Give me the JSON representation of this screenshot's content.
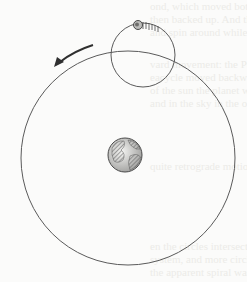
{
  "diagram": {
    "title": "",
    "colors": {
      "line": "#5a5a5a",
      "background": "#fbfbfa",
      "earth": "#6b6b6b"
    },
    "deferent": {
      "cx": 128,
      "cy": 158,
      "r": 107
    },
    "epicycle": {
      "cx": 143,
      "cy": 55,
      "r": 32
    },
    "planet": {
      "cx": 138,
      "cy": 25,
      "r": 4
    },
    "earth": {
      "cx": 125,
      "cy": 155,
      "r": 17
    },
    "arrow": {
      "direction": "counter-clockwise",
      "label": ""
    }
  },
  "bleed_through_text": [
    "ond, which moved both west",
    "then backed up. And the effect",
    "and spin around while tracing",
    "vard movement: the Ptolemaic",
    "eacycle moved backward along",
    "of the sun the planet would",
    "and in the sky in the opposite",
    "quite retrograde motions.",
    "en the circles intersected",
    "system, and more circles were",
    "the apparent spiral was added"
  ]
}
